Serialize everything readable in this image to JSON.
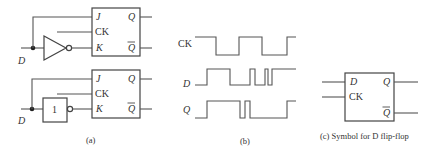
{
  "panel_a": {
    "top": {
      "input_label": "D",
      "ff_pins": {
        "j": "J",
        "ck": "CK",
        "k": "K",
        "q": "Q",
        "qbar": "Q"
      },
      "gate": "inverter"
    },
    "bottom": {
      "input_label": "D",
      "ff_pins": {
        "j": "J",
        "ck": "CK",
        "k": "K",
        "q": "Q",
        "qbar": "Q"
      },
      "gate_label": "1"
    },
    "caption": "(a)"
  },
  "panel_b": {
    "signals": [
      {
        "label": "CK"
      },
      {
        "label": "D"
      },
      {
        "label": "Q"
      }
    ],
    "caption": "(b)"
  },
  "panel_c": {
    "pins": {
      "d": "D",
      "ck": "CK",
      "q": "Q",
      "qbar": "Q"
    },
    "caption": "(c) Symbol for D flip-flop"
  }
}
